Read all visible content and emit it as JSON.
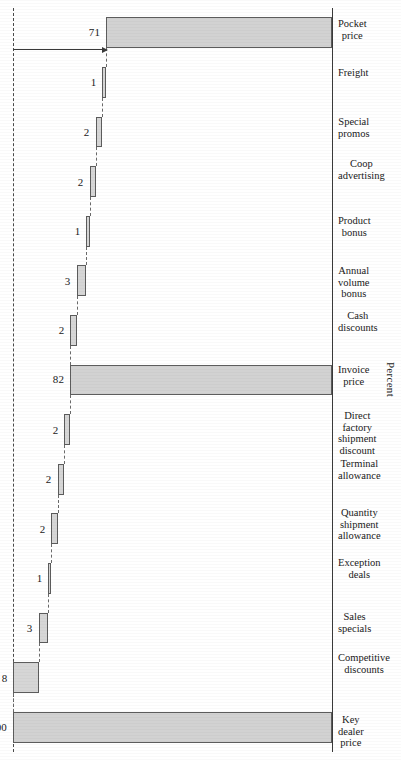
{
  "chart_data": {
    "type": "bar",
    "subtype": "waterfall",
    "title": "",
    "xlabel": "",
    "ylabel": "Percent",
    "ylim": [
      0,
      100
    ],
    "grid": false,
    "legend": null,
    "orientation": "page-rotated-90ccw",
    "reference_line": {
      "value": 100,
      "style": "dashed"
    },
    "categories": [
      "Key\ndealer\nprice",
      "Competitive\ndiscounts",
      "Sales\nspecials",
      "Exception\ndeals",
      "Quantity\nshipment\nallowance",
      "Terminal\nallowance",
      "Direct\nfactory\nshipment\ndiscount",
      "Invoice\nprice",
      "Cash\ndiscounts",
      "Annual\nvolume\nbonus",
      "Product\nbonus",
      "Coop\nadvertising",
      "Special\npromos",
      "Freight",
      "Pocket\nprice"
    ],
    "value_labels": [
      "100",
      "8",
      "3",
      "1",
      "2",
      "2",
      "2",
      "82",
      "2",
      "3",
      "1",
      "2",
      "2",
      "1",
      "71"
    ],
    "values": [
      100,
      8,
      3,
      1,
      2,
      2,
      2,
      82,
      2,
      3,
      1,
      2,
      2,
      1,
      71
    ],
    "kinds": [
      "total",
      "decrease",
      "decrease",
      "decrease",
      "decrease",
      "decrease",
      "decrease",
      "total",
      "decrease",
      "decrease",
      "decrease",
      "decrease",
      "decrease",
      "decrease",
      "total"
    ],
    "cumulative_top": [
      100,
      100,
      92,
      89,
      88,
      86,
      84,
      82,
      82,
      80,
      77,
      76,
      74,
      72,
      71
    ],
    "cumulative_bottom": [
      0,
      92,
      89,
      88,
      86,
      84,
      82,
      0,
      80,
      77,
      76,
      74,
      72,
      71,
      0
    ]
  },
  "annotation": {
    "text": "Average \"Pocket discount\" of 29%",
    "from_value": 100,
    "to_value": 71
  },
  "axis": {
    "y_title": "Percent"
  }
}
